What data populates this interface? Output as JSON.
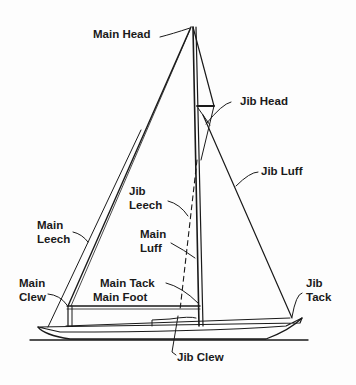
{
  "diagram": {
    "colors": {
      "ink": "#1a1a1a",
      "background": "#fdfdfd"
    },
    "labels": {
      "main_head": "Main Head",
      "jib_head": "Jib Head",
      "jib_luff": "Jib Luff",
      "jib_leech": [
        "Jib",
        "Leech"
      ],
      "main_leech": [
        "Main",
        "Leech"
      ],
      "main_luff": [
        "Main",
        "Luff"
      ],
      "main_clew": [
        "Main",
        "Clew"
      ],
      "main_tack": "Main Tack",
      "main_foot": "Main Foot",
      "jib_tack": [
        "Jib",
        "Tack"
      ],
      "jib_clew": "Jib Clew"
    }
  }
}
